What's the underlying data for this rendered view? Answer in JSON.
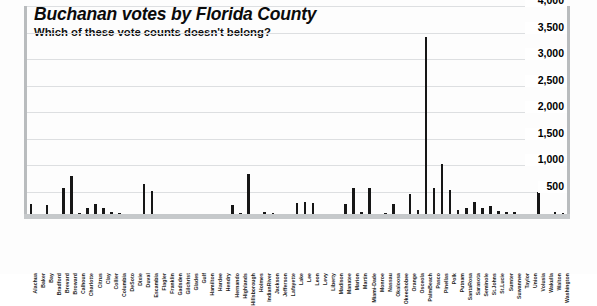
{
  "header": {
    "title": "Buchanan votes by Florida County",
    "subtitle": "Which of these vote counts doesn't belong?"
  },
  "chart_data": {
    "type": "bar",
    "title": "Buchanan votes by Florida County",
    "subtitle": "Which of these vote counts doesn't belong?",
    "xlabel": "",
    "ylabel": "",
    "ylim": [
      0,
      4000
    ],
    "yticks": [
      500,
      1000,
      1500,
      2000,
      2500,
      3000,
      3500,
      4000
    ],
    "ytick_labels": [
      "500",
      "1,000",
      "1,500",
      "2,000",
      "2,500",
      "3,000",
      "3,500",
      "4,000"
    ],
    "grid": true,
    "legend": false,
    "bar_color": "#161616",
    "grid_color": "#dddfe1",
    "axis_color": "#b9bcbe",
    "annotation": "Palm Beach is the outlier spike near 3,400",
    "categories": [
      "Alachua",
      "Baker",
      "Bay",
      "Bradford",
      "Brevard",
      "Broward",
      "Calhoun",
      "Charlotte",
      "Citrus",
      "Clay",
      "Collier",
      "Columbia",
      "DeSoto",
      "Dixie",
      "Duval",
      "Escambia",
      "Flagler",
      "Franklin",
      "Gadsden",
      "Gilchrist",
      "Glades",
      "Gulf",
      "Hamilton",
      "Hardee",
      "Hendry",
      "Hernando",
      "Highlands",
      "Hillsborough",
      "Holmes",
      "IndianRiver",
      "Jackson",
      "Jefferson",
      "Lafayette",
      "Lake",
      "Lee",
      "Leon",
      "Levy",
      "Liberty",
      "Madison",
      "Manatee",
      "Marion",
      "Martin",
      "Miami-Dade",
      "Monroe",
      "Nassau",
      "Okaloosa",
      "Okeechobee",
      "Orange",
      "Osceola",
      "PalmBeach",
      "Pasco",
      "Pinellas",
      "Polk",
      "Putnam",
      "SantaRosa",
      "Sarasota",
      "Seminole",
      "St.Johns",
      "St.Lucie",
      "Sumter",
      "Suwannee",
      "Taylor",
      "Union",
      "Volusia",
      "Wakulla",
      "Walton",
      "Washington"
    ],
    "values": [
      263,
      73,
      248,
      65,
      570,
      795,
      90,
      182,
      270,
      186,
      122,
      89,
      36,
      29,
      650,
      504,
      83,
      33,
      39,
      29,
      9,
      71,
      24,
      30,
      22,
      242,
      99,
      836,
      76,
      105,
      102,
      29,
      10,
      289,
      305,
      282,
      67,
      39,
      29,
      272,
      563,
      108,
      561,
      47,
      90,
      267,
      43,
      446,
      145,
      3407,
      570,
      1010,
      538,
      147,
      182,
      305,
      194,
      229,
      124,
      114,
      108,
      27,
      26,
      498,
      46,
      120,
      88
    ]
  }
}
